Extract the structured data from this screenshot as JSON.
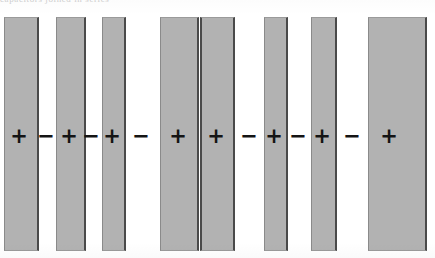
{
  "figure": {
    "title_strip": "capacitors joined in series",
    "width": 435,
    "height": 258,
    "background_color": "#ffffff",
    "plate_color": "#b2b2b2",
    "plate_edge_color": "#4a4a4a",
    "sign_color": "#141414",
    "plate_top": 17,
    "plate_bottom": 251
  },
  "plates": [
    {
      "label": "plate-1",
      "x": 4,
      "width": 35,
      "sign": "+",
      "sign_x": 19
    },
    {
      "label": "plate-2",
      "x": 56,
      "width": 30,
      "sign": "+",
      "sign_x": 69
    },
    {
      "label": "plate-3",
      "x": 102,
      "width": 24,
      "sign": "+",
      "sign_x": 112
    },
    {
      "label": "plate-4",
      "x": 160,
      "width": 39,
      "sign": "+",
      "sign_x": 178
    },
    {
      "label": "plate-5",
      "x": 200,
      "width": 35,
      "sign": "+",
      "sign_x": 216
    },
    {
      "label": "plate-6",
      "x": 264,
      "width": 24,
      "sign": "+",
      "sign_x": 274
    },
    {
      "label": "plate-7",
      "x": 311,
      "width": 26,
      "sign": "+",
      "sign_x": 322
    },
    {
      "label": "plate-8",
      "x": 368,
      "width": 59,
      "sign": "+",
      "sign_x": 389
    }
  ],
  "gap_signs": [
    {
      "label": "gap-1",
      "sign": "−",
      "x": 46
    },
    {
      "label": "gap-2",
      "sign": "−",
      "x": 91
    },
    {
      "label": "gap-3",
      "sign": "−",
      "x": 141
    },
    {
      "label": "gap-4",
      "sign": "−",
      "x": 249
    },
    {
      "label": "gap-5",
      "sign": "−",
      "x": 298
    },
    {
      "label": "gap-6",
      "sign": "−",
      "x": 352
    }
  ],
  "sign_center_y": 136
}
